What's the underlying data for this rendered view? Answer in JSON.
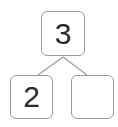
{
  "diagram": {
    "type": "number-bond",
    "whole": {
      "value": "3"
    },
    "parts": [
      {
        "value": "2"
      },
      {
        "value": ""
      }
    ],
    "colors": {
      "border": "#9a9a9a",
      "connector": "#9a9a9a",
      "text": "#2b2b2b",
      "background": "#ffffff"
    }
  }
}
